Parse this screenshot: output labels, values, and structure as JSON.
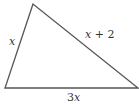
{
  "diagram": {
    "type": "triangle",
    "stroke_color": "#555555",
    "vertices": {
      "top": [
        33,
        4
      ],
      "bottom_left": [
        5,
        88
      ],
      "bottom_right": [
        138,
        88
      ]
    },
    "sides": {
      "left": {
        "label": "x"
      },
      "right": {
        "label_var": "x",
        "label_rest": " + 2"
      },
      "base": {
        "label_coef": "3",
        "label_var": "x"
      }
    }
  }
}
